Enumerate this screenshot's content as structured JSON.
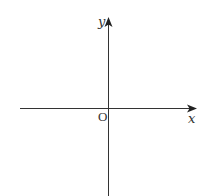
{
  "diagram": {
    "type": "coordinate-axes",
    "x_axis": {
      "label": "x",
      "arrow": "right"
    },
    "y_axis": {
      "label": "y",
      "arrow": "up"
    },
    "origin": {
      "label": "O"
    },
    "colors": {
      "axis": "#333333",
      "background": "#ffffff"
    }
  }
}
